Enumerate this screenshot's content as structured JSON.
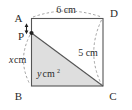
{
  "figure": {
    "kind": "geometry-diagram",
    "shape": "rectangle-with-shaded-triangle",
    "background_color": "#ffffff",
    "outline_color": "#555555",
    "shading_color": "#dedede",
    "dash_color": "#8a8a8a",
    "text_color": "#2b2b2b"
  },
  "vertices": {
    "a": "A",
    "b": "B",
    "c": "C",
    "d": "D",
    "p": "P"
  },
  "measures": {
    "top_length": "6 cm",
    "right_length": "5 cm",
    "left_segment": "x cm",
    "left_segment_variable": "x",
    "left_segment_unit": "cm",
    "area": "y cm",
    "area_variable": "y",
    "area_unit": "cm",
    "area_exponent": "2"
  },
  "annotations": {
    "ap_arrow": "double-headed-arrow-A-to-P",
    "top_arc": "dashed-arc-A-to-D",
    "right_arc": "dashed-arc-D-to-C",
    "left_arc": "dashed-arc-P-to-B"
  }
}
